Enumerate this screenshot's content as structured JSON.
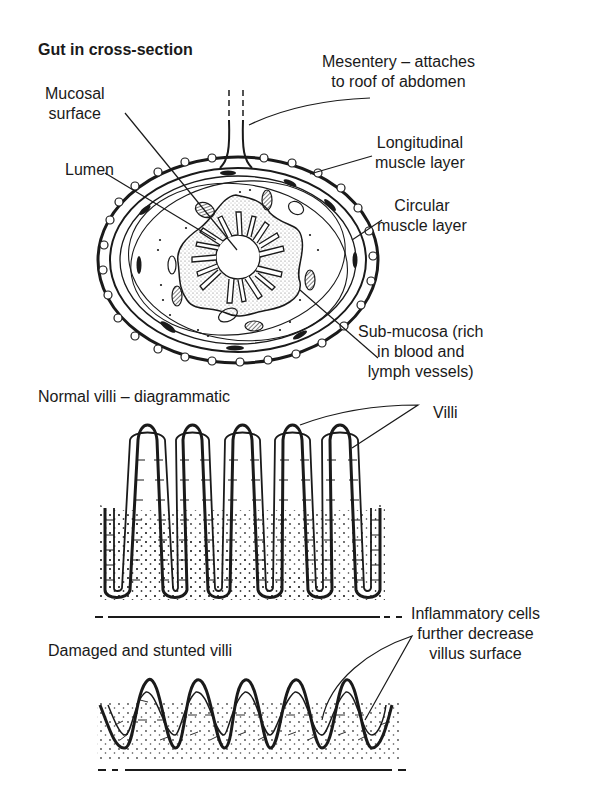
{
  "figure": {
    "title": "Gut in cross-section",
    "cross_section_labels": {
      "mucosal_surface": [
        "Mucosal",
        "surface"
      ],
      "lumen": "Lumen",
      "mesentery": [
        "Mesentery – attaches",
        "to roof of abdomen"
      ],
      "longitudinal": [
        "Longitudinal",
        "muscle layer"
      ],
      "circular": [
        "Circular",
        "muscle layer"
      ],
      "submucosa": [
        "Sub-mucosa (rich",
        "in blood and",
        "lymph vessels)"
      ]
    },
    "normal_villi": {
      "heading": "Normal villi – diagrammatic",
      "label": "Villi",
      "villus_count": 5
    },
    "damaged_villi": {
      "heading": "Damaged and stunted villi",
      "label": [
        "Inflammatory cells",
        "further decrease",
        "villus surface"
      ],
      "villus_count": 5
    },
    "colors": {
      "ink": "#1a1a1a",
      "background": "#ffffff"
    }
  }
}
